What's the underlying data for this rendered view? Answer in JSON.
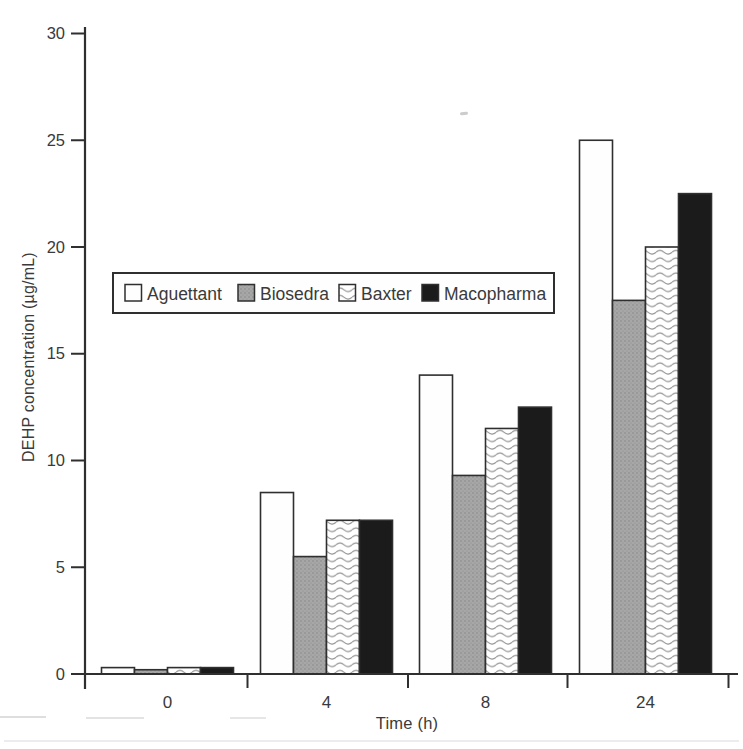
{
  "chart_data": {
    "type": "bar",
    "title": "",
    "xlabel": "Time (h)",
    "ylabel": "DEHP concentration (µg/mL)",
    "categories": [
      "0",
      "4",
      "8",
      "24"
    ],
    "series": [
      {
        "name": "Aguettant",
        "style": "white",
        "values": [
          0.3,
          8.5,
          14,
          25
        ]
      },
      {
        "name": "Biosedra",
        "style": "stipple-gray",
        "values": [
          0.2,
          5.5,
          9.3,
          17.5
        ]
      },
      {
        "name": "Baxter",
        "style": "wave",
        "values": [
          0.3,
          7.2,
          11.5,
          20
        ]
      },
      {
        "name": "Macopharma",
        "style": "black",
        "values": [
          0.3,
          7.2,
          12.5,
          22.5
        ]
      }
    ],
    "ylim": [
      0,
      30
    ],
    "yticks": [
      0,
      5,
      10,
      15,
      20,
      25,
      30
    ],
    "grid": false,
    "legend_position": "inside upper-left, horizontal boxed",
    "colors": {
      "outline": "#2f2f2f",
      "text": "#3a3a3a",
      "white_fill": "#fefefe",
      "gray_fill": "#a0a0a0",
      "black_fill": "#1b1b1b",
      "background": "#ffffff"
    }
  }
}
